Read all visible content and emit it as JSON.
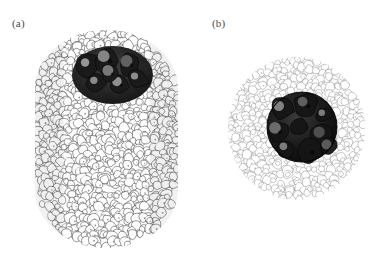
{
  "figure": {
    "background_color": "#ffffff",
    "width": 391,
    "height": 267,
    "style": "grayscale-line-art-render",
    "caption": ""
  },
  "panels": [
    {
      "key": "a",
      "label": "(a)",
      "view": "side-view",
      "outer_shape": "capsule",
      "description": "Densely packed granular capsule with dark core cluster near top",
      "bounds": {
        "x": 35,
        "y": 30,
        "width": 143,
        "height": 218
      },
      "shell": {
        "name": "outer-granular-shell",
        "fill_color": "#ffffff",
        "stroke_color": "#3a3a3a",
        "tone": "#9a9a9a",
        "density": "dense",
        "particle_count": 520,
        "particle_radius_range": [
          3.0,
          6.2
        ]
      },
      "core": {
        "name": "dark-core-cluster",
        "fill_color": "#1a1a1a",
        "stroke_color": "#000000",
        "tone": "#242424",
        "bounds": {
          "x": 75,
          "y": 48,
          "width": 75,
          "height": 54
        },
        "particle_count": 6,
        "particle_radius_range": [
          9.0,
          15.0
        ]
      }
    },
    {
      "key": "b",
      "label": "(b)",
      "view": "cross-section",
      "outer_shape": "circle",
      "description": "Annular cross-section: sparse light granular shell surrounding a dark spherical core",
      "bounds": {
        "x": 32,
        "y": 57,
        "width": 137,
        "height": 143
      },
      "shell": {
        "name": "outer-granular-shell",
        "fill_color": "#ffffff",
        "stroke_color": "#777777",
        "tone": "#c9c9c9",
        "density": "sparse",
        "particle_count": 330,
        "particle_radius_range": [
          2.6,
          5.4
        ]
      },
      "core": {
        "name": "dark-core-sphere",
        "fill_color": "#141414",
        "stroke_color": "#000000",
        "tone": "#1e1e1e",
        "bounds": {
          "x": 71,
          "y": 92,
          "width": 70,
          "height": 70
        },
        "particle_count": 9,
        "particle_radius_range": [
          8.0,
          14.0
        ]
      }
    }
  ],
  "colors": {
    "background": "#ffffff",
    "label_text": "#4a4a4a",
    "grain_outline_dark": "#3a3a3a",
    "grain_outline_light": "#777777",
    "core_dark": "#141414",
    "core_highlight": "#d8d8d8"
  }
}
